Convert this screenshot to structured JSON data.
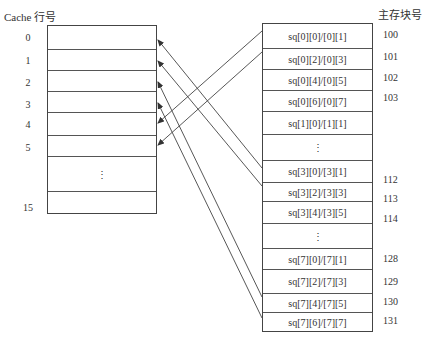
{
  "cache": {
    "title": "Cache 行号",
    "row_labels": [
      "0",
      "1",
      "2",
      "3",
      "4",
      "5",
      "15"
    ],
    "ellipsis": "⋮"
  },
  "memory": {
    "title": "主存块号",
    "rows": [
      {
        "label": "sq[0][0]/[0][1]",
        "block": "100"
      },
      {
        "label": "sq[0][2]/[0][3]",
        "block": "101"
      },
      {
        "label": "sq[0][4]/[0][5]",
        "block": "102"
      },
      {
        "label": "sq[0][6]/[0][7]",
        "block": "103"
      },
      {
        "label": "sq[1][0]/[1][1]",
        "block": ""
      },
      {
        "label": "⋮",
        "block": ""
      },
      {
        "label": "sq[3][0]/[3][1]",
        "block": "112"
      },
      {
        "label": "sq[3][2]/[3][3]",
        "block": "113"
      },
      {
        "label": "sq[3][4]/[3][5]",
        "block": "114"
      },
      {
        "label": "⋮",
        "block": ""
      },
      {
        "label": "sq[7][0]/[7][1]",
        "block": "128"
      },
      {
        "label": "sq[7][2]/[7][3]",
        "block": "129"
      },
      {
        "label": "sq[7][4]/[7][5]",
        "block": "130"
      },
      {
        "label": "sq[7][6]/[7][7]",
        "block": "131"
      }
    ]
  },
  "mappings": [
    {
      "from": "sq[0][0]/[0][1]",
      "to_cache_row": "4"
    },
    {
      "from": "sq[0][2]/[0][3]",
      "to_cache_row": "5"
    },
    {
      "from": "sq[3][0]/[3][1]",
      "to_cache_row": "0"
    },
    {
      "from": "sq[3][2]/[3][3]",
      "to_cache_row": "1"
    },
    {
      "from": "sq[7][4]/[7][5]",
      "to_cache_row": "2"
    },
    {
      "from": "sq[7][6]/[7][7]",
      "to_cache_row": "3"
    }
  ],
  "colors": {
    "line": "#444444",
    "text": "#333333",
    "background": "#ffffff"
  }
}
